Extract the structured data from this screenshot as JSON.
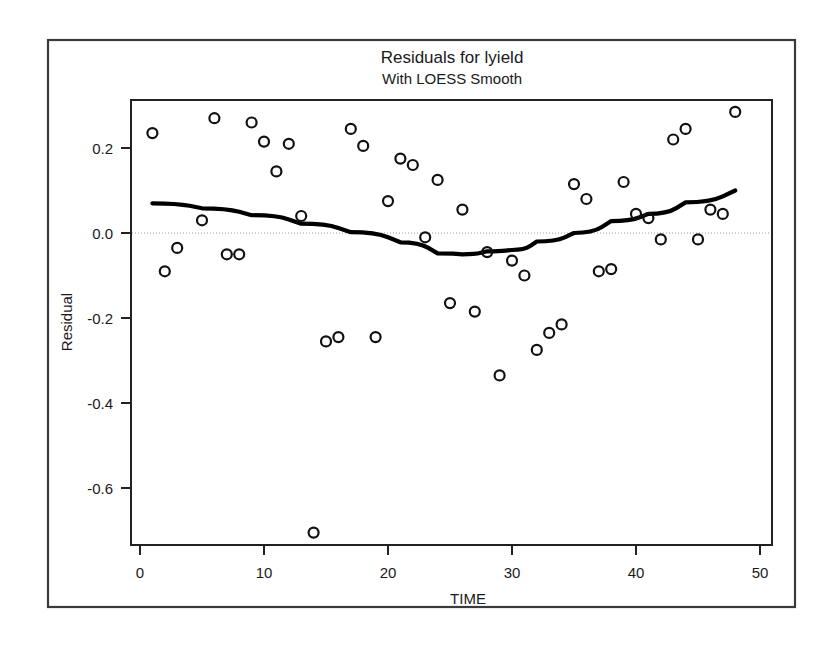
{
  "chart_data": {
    "type": "scatter",
    "title": "Residuals for lyield",
    "subtitle": "With LOESS Smooth",
    "xlabel": "TIME",
    "ylabel": "Residual",
    "xlim": [
      0,
      50
    ],
    "ylim": [
      -0.78,
      0.32
    ],
    "xticks": [
      0,
      10,
      20,
      30,
      40,
      50
    ],
    "xticklabels": [
      "0",
      "10",
      "20",
      "30",
      "40",
      "50"
    ],
    "yticks": [
      0.2,
      0.0,
      -0.2,
      -0.4,
      -0.6
    ],
    "yticklabels": [
      "0.2",
      "0.0",
      "-0.2",
      "-0.4",
      "-0.6"
    ],
    "grid": false,
    "reference_line_y": 0.0,
    "legend": null,
    "marker_style": "open-circle",
    "series": [
      {
        "name": "Residual",
        "type": "scatter",
        "x": [
          1,
          2,
          3,
          5,
          6,
          7,
          8,
          9,
          10,
          11,
          12,
          13,
          14,
          15,
          16,
          17,
          18,
          19,
          20,
          21,
          22,
          23,
          24,
          25,
          26,
          27,
          28,
          29,
          30,
          31,
          32,
          33,
          34,
          35,
          36,
          37,
          38,
          39,
          40,
          41,
          42,
          43,
          44,
          45,
          46,
          47,
          48
        ],
        "y": [
          0.235,
          -0.09,
          -0.035,
          0.03,
          0.27,
          -0.05,
          -0.05,
          0.26,
          0.215,
          0.145,
          0.21,
          0.04,
          -0.705,
          -0.255,
          -0.245,
          0.245,
          0.205,
          -0.245,
          0.075,
          0.175,
          0.16,
          -0.01,
          0.125,
          -0.165,
          0.055,
          -0.185,
          -0.045,
          -0.335,
          -0.065,
          -0.1,
          -0.275,
          -0.235,
          -0.215,
          0.115,
          0.08,
          -0.09,
          -0.085,
          0.12,
          0.045,
          0.035,
          -0.015,
          0.22,
          0.245,
          -0.015,
          0.055,
          0.045,
          0.285
        ]
      },
      {
        "name": "LOESS Smooth",
        "type": "line",
        "x": [
          1,
          5,
          9,
          13,
          17,
          21,
          24,
          26,
          28,
          30,
          32,
          35,
          38,
          41,
          44,
          48
        ],
        "y": [
          0.07,
          0.058,
          0.042,
          0.022,
          0.002,
          -0.022,
          -0.048,
          -0.05,
          -0.043,
          -0.04,
          -0.02,
          0.0,
          0.028,
          0.045,
          0.072,
          0.1
        ]
      }
    ]
  },
  "axes": {
    "y_axis_title": "Residual",
    "x_axis_title": "TIME"
  }
}
